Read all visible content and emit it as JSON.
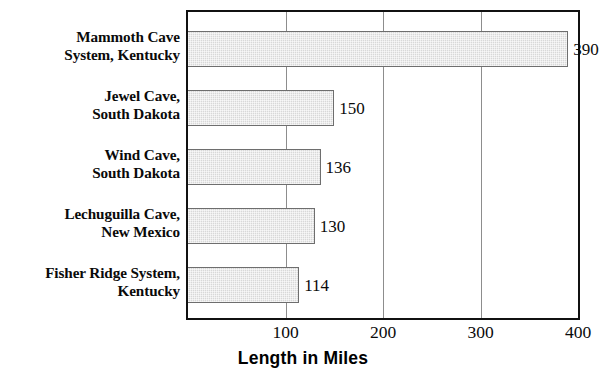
{
  "chart_data": {
    "type": "bar",
    "orientation": "horizontal",
    "title": "",
    "xlabel": "Length in Miles",
    "ylabel": "",
    "xlim": [
      0,
      400
    ],
    "xticks": [
      100,
      200,
      300,
      400
    ],
    "xtick_labels": [
      "100",
      "200",
      "300",
      "400"
    ],
    "grid": true,
    "grid_axis": "x",
    "legend": false,
    "categories": [
      "Mammoth Cave System, Kentucky",
      "Jewel Cave, South Dakota",
      "Wind Cave, South Dakota",
      "Lechuguilla Cave, New Mexico",
      "Fisher Ridge System, Kentucky"
    ],
    "values": [
      390,
      150,
      136,
      130,
      114
    ],
    "value_labels": [
      "390",
      "150",
      "136",
      "130",
      "114"
    ],
    "colors": {
      "bar_fill": "#d8d8d8",
      "bar_border": "#6e6e6e",
      "frame": "#111111",
      "gridline": "#8d8d8d",
      "text": "#0a0a0a"
    }
  },
  "categories_wrapped": [
    [
      "Mammoth Cave",
      "System, Kentucky"
    ],
    [
      "Jewel Cave,",
      "South Dakota"
    ],
    [
      "Wind Cave,",
      "South Dakota"
    ],
    [
      "Lechuguilla Cave,",
      "New Mexico"
    ],
    [
      "Fisher Ridge System,",
      "Kentucky"
    ]
  ],
  "axis": {
    "title": "Length in Miles",
    "ticks": [
      "100",
      "200",
      "300",
      "400"
    ]
  }
}
